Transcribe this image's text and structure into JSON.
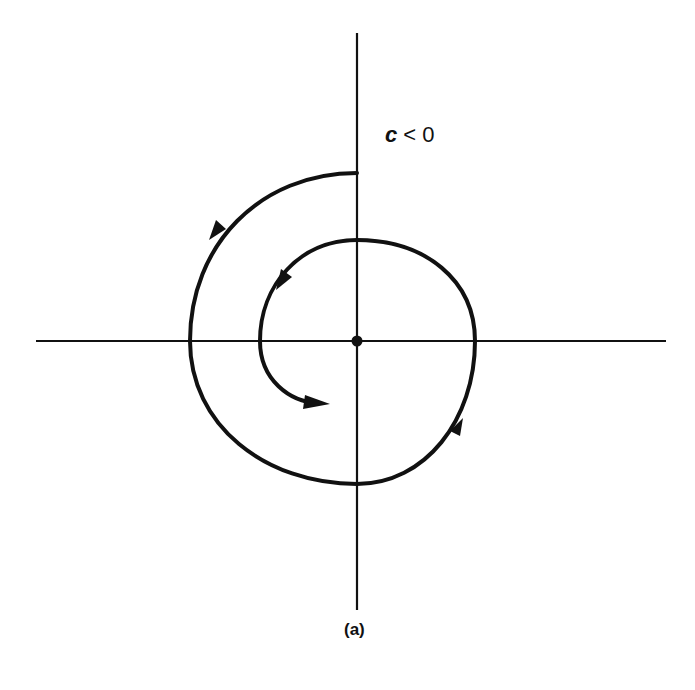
{
  "figure": {
    "type": "phase-portrait",
    "condition_label": {
      "variable": "c",
      "relation": " < 0"
    },
    "caption": "(a)",
    "colors": {
      "ink": "#111111",
      "background": "#ffffff"
    },
    "axes": {
      "origin": [
        357,
        341
      ],
      "horizontal": {
        "x1": 36,
        "x2": 666,
        "y": 341
      },
      "vertical": {
        "x": 357,
        "y1": 33,
        "y2": 610
      }
    },
    "trajectory": {
      "direction": "counterclockwise",
      "start": [
        357,
        173
      ],
      "end": [
        330,
        404
      ],
      "arrowheads": 4
    },
    "equilibrium_point": {
      "x": 357,
      "y": 341,
      "marker": "filled-dot"
    }
  }
}
